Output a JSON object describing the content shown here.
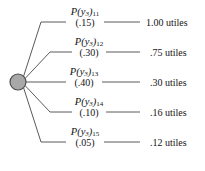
{
  "figure": {
    "type": "decision-tree-chance-node",
    "node": {
      "name": "chance-node",
      "shape": "circle",
      "fill_color": "#a8a8a8",
      "stroke_color": "#4d4d4d",
      "center_x": 18,
      "center_y": 82,
      "radius": 8
    },
    "line_color": "#5a5a5a",
    "text_color": "#141414",
    "background_color": "#ffffff"
  },
  "branches": [
    {
      "id": "branch-1",
      "prob_label_prefix": "P",
      "prob_label_var": "y",
      "prob_label_var_sub": "3",
      "prob_label_index": "11",
      "prob_value": "(.15)",
      "utility": "1.00 utiles",
      "utility_number": 1.0,
      "probability": 0.15,
      "line_y": 22
    },
    {
      "id": "branch-2",
      "prob_label_prefix": "P",
      "prob_label_var": "y",
      "prob_label_var_sub": "3",
      "prob_label_index": "12",
      "prob_value": "(.30)",
      "utility": ".75 utiles",
      "utility_number": 0.75,
      "probability": 0.3,
      "line_y": 52
    },
    {
      "id": "branch-3",
      "prob_label_prefix": "P",
      "prob_label_var": "y",
      "prob_label_var_sub": "3",
      "prob_label_index": "13",
      "prob_value": "(.40)",
      "utility": ".30 utiles",
      "utility_number": 0.3,
      "probability": 0.4,
      "line_y": 82
    },
    {
      "id": "branch-4",
      "prob_label_prefix": "P",
      "prob_label_var": "y",
      "prob_label_var_sub": "3",
      "prob_label_index": "14",
      "prob_value": "(.10)",
      "utility": ".16 utiles",
      "utility_number": 0.16,
      "probability": 0.1,
      "line_y": 112
    },
    {
      "id": "branch-5",
      "prob_label_prefix": "P",
      "prob_label_var": "y",
      "prob_label_var_sub": "3",
      "prob_label_index": "15",
      "prob_value": "(.05)",
      "utility": ".12 utiles",
      "utility_number": 0.12,
      "probability": 0.05,
      "line_y": 142
    }
  ]
}
